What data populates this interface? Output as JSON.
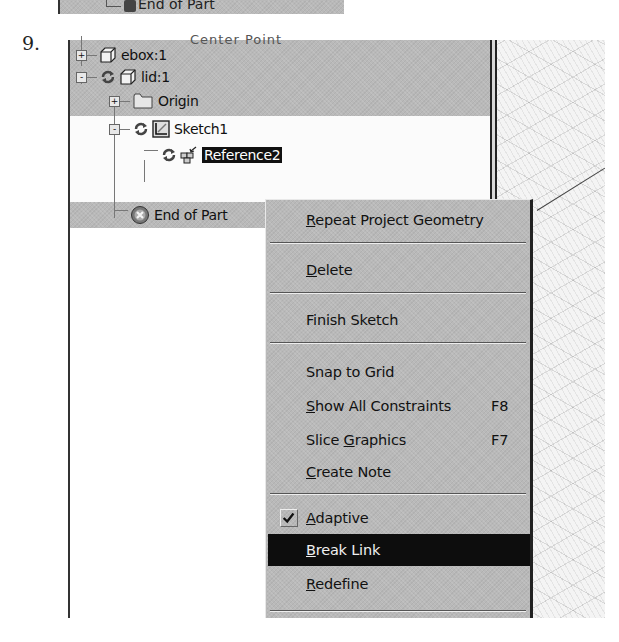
{
  "step_number": "9.",
  "previous_fragment": {
    "label": "End of Part"
  },
  "browser": {
    "partial_header": "Center Point",
    "tree": [
      {
        "label": "ebox:1",
        "expander": "+",
        "icon": "part-cube-icon",
        "adaptive": false
      },
      {
        "label": "lid:1",
        "expander": "-",
        "icon": "part-cube-icon",
        "adaptive": true
      },
      {
        "label": "Origin",
        "expander": "+",
        "icon": "folder-icon",
        "adaptive": false
      },
      {
        "label": "Sketch1",
        "expander": "-",
        "icon": "sketch-icon",
        "adaptive": true
      },
      {
        "label": "Reference2",
        "expander": "",
        "icon": "projected-geometry-icon",
        "adaptive": true,
        "selected": true
      },
      {
        "label": "End of Part",
        "expander": "",
        "icon": "end-of-part-icon",
        "adaptive": false
      }
    ]
  },
  "context_menu": {
    "items": [
      {
        "pre": "",
        "mnemonic": "R",
        "post": "epeat Project Geometry",
        "shortcut": ""
      },
      {
        "pre": "",
        "mnemonic": "D",
        "post": "elete",
        "shortcut": ""
      },
      {
        "pre": "Finish Sketch",
        "mnemonic": "",
        "post": "",
        "shortcut": ""
      },
      {
        "pre": "Snap to Grid",
        "mnemonic": "",
        "post": "",
        "shortcut": ""
      },
      {
        "pre": "",
        "mnemonic": "S",
        "post": "how All Constraints",
        "shortcut": "F8"
      },
      {
        "pre": "Slice ",
        "mnemonic": "G",
        "post": "raphics",
        "shortcut": "F7"
      },
      {
        "pre": "",
        "mnemonic": "C",
        "post": "reate Note",
        "shortcut": ""
      },
      {
        "pre": "",
        "mnemonic": "A",
        "post": "daptive",
        "shortcut": "",
        "checked": true
      },
      {
        "pre": "",
        "mnemonic": "B",
        "post": "reak Link",
        "shortcut": "",
        "highlighted": true
      },
      {
        "pre": "",
        "mnemonic": "R",
        "post": "edefine",
        "shortcut": ""
      }
    ]
  },
  "colors": {
    "panel_gray": "#b9b9b9",
    "highlight_bg": "#0d0d0d",
    "highlight_fg": "#f0f0f0"
  }
}
